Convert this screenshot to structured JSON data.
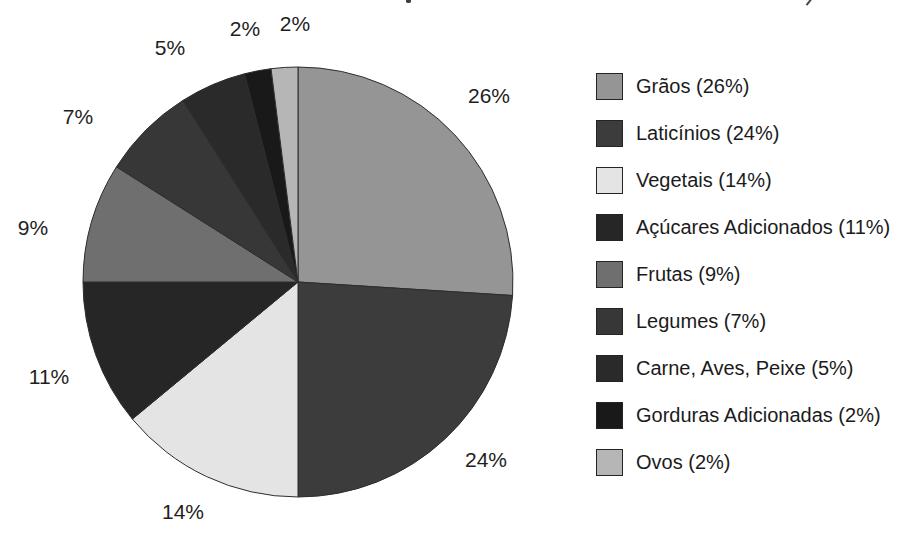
{
  "chart_data": {
    "type": "pie",
    "title": "",
    "direction": "clockwise",
    "start_angle_deg": 0,
    "unit": "percent",
    "grid": false,
    "legend_position": "right",
    "slices": [
      {
        "label": "Grãos",
        "value": 26,
        "color": "#959595",
        "pct_label": "26%",
        "legend_label": "Grãos (26%)",
        "pct_label_pos": {
          "x": 489,
          "y": 96
        }
      },
      {
        "label": "Laticínios",
        "value": 24,
        "color": "#3c3c3c",
        "pct_label": "24%",
        "legend_label": "Laticínios (24%)",
        "pct_label_pos": {
          "x": 486,
          "y": 460
        }
      },
      {
        "label": "Vegetais",
        "value": 14,
        "color": "#e4e4e4",
        "pct_label": "14%",
        "legend_label": "Vegetais (14%)",
        "pct_label_pos": {
          "x": 183,
          "y": 512
        }
      },
      {
        "label": "Açúcares Adicionados",
        "value": 11,
        "color": "#262626",
        "pct_label": "11%",
        "legend_label": "Açúcares Adicionados (11%)",
        "pct_label_pos": {
          "x": 49,
          "y": 377
        }
      },
      {
        "label": "Frutas",
        "value": 9,
        "color": "#6f6f6f",
        "pct_label": "9%",
        "legend_label": "Frutas (9%)",
        "pct_label_pos": {
          "x": 33,
          "y": 228
        }
      },
      {
        "label": "Legumes",
        "value": 7,
        "color": "#373737",
        "pct_label": "7%",
        "legend_label": "Legumes (7%)",
        "pct_label_pos": {
          "x": 78,
          "y": 117
        }
      },
      {
        "label": "Carne, Aves, Peixe",
        "value": 5,
        "color": "#2a2a2a",
        "pct_label": "5%",
        "legend_label": "Carne, Aves, Peixe (5%)",
        "pct_label_pos": {
          "x": 170,
          "y": 48
        }
      },
      {
        "label": "Gorduras Adicionadas",
        "value": 2,
        "color": "#191919",
        "pct_label": "2%",
        "legend_label": "Gorduras Adicionadas (2%)",
        "pct_label_pos": {
          "x": 245,
          "y": 29
        }
      },
      {
        "label": "Ovos",
        "value": 2,
        "color": "#b6b6b6",
        "pct_label": "2%",
        "legend_label": "Ovos (2%)",
        "pct_label_pos": {
          "x": 295,
          "y": 24
        }
      }
    ]
  }
}
